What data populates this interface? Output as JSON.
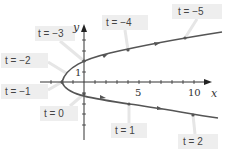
{
  "diagram": {
    "axes": {
      "x_label": "x",
      "y_label": "y",
      "x_ticks": [
        "5",
        "10"
      ],
      "y_ticks": [
        "1"
      ]
    },
    "points": [
      {
        "label": "t = −5",
        "px": 185,
        "py": 38,
        "box": [
          172,
          4,
          50,
          15
        ]
      },
      {
        "label": "t = −4",
        "px": 128,
        "py": 50,
        "box": [
          102,
          15,
          46,
          15
        ]
      },
      {
        "label": "t = −3",
        "px": 84,
        "py": 61,
        "box": [
          35,
          26,
          40,
          15
        ]
      },
      {
        "label": "t = −2",
        "px": 66,
        "py": 73,
        "box": [
          1,
          53,
          47,
          15
        ]
      },
      {
        "label": "t = −1",
        "px": 62,
        "py": 82,
        "box": [
          1,
          84,
          47,
          15
        ]
      },
      {
        "label": "t = 0",
        "px": 84,
        "py": 94,
        "box": [
          40,
          106,
          38,
          15
        ]
      },
      {
        "label": "t = 1",
        "px": 129,
        "py": 104,
        "box": [
          111,
          123,
          36,
          15
        ]
      },
      {
        "label": "t = 2",
        "px": 193,
        "py": 115,
        "box": [
          178,
          134,
          40,
          15
        ]
      }
    ],
    "colors": {
      "curve": "#555555",
      "axis": "#333333",
      "label_bg": "#eeeeee",
      "leader": "#e4e4e4"
    }
  }
}
